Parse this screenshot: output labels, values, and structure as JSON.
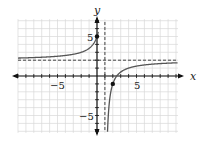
{
  "chart_data": {
    "type": "line",
    "title": "",
    "function": "f(x) = 2 - 3/(x - 1)",
    "xlabel": "x",
    "ylabel": "y",
    "xlim": [
      -10,
      10
    ],
    "ylim": [
      -7,
      7
    ],
    "grid": true,
    "x_tick_labels": [
      {
        "value": -5,
        "label": "−5"
      },
      {
        "value": 5,
        "label": "5"
      }
    ],
    "y_tick_labels": [
      {
        "value": 5,
        "label": "5"
      },
      {
        "value": -5,
        "label": "−5"
      }
    ],
    "asymptotes": {
      "vertical": 1,
      "horizontal": 2
    },
    "points": [
      {
        "x": 0,
        "y": 5
      },
      {
        "x": 2,
        "y": -1
      }
    ],
    "colors": {
      "curve": "#555555",
      "axis": "#111111",
      "grid": "#d8d8d8",
      "asymptote": "#444444"
    }
  },
  "labels": {
    "x_axis": "x",
    "y_axis": "y",
    "x_neg5": "−5",
    "x_pos5": "5",
    "y_pos5": "5",
    "y_neg5": "−5"
  }
}
